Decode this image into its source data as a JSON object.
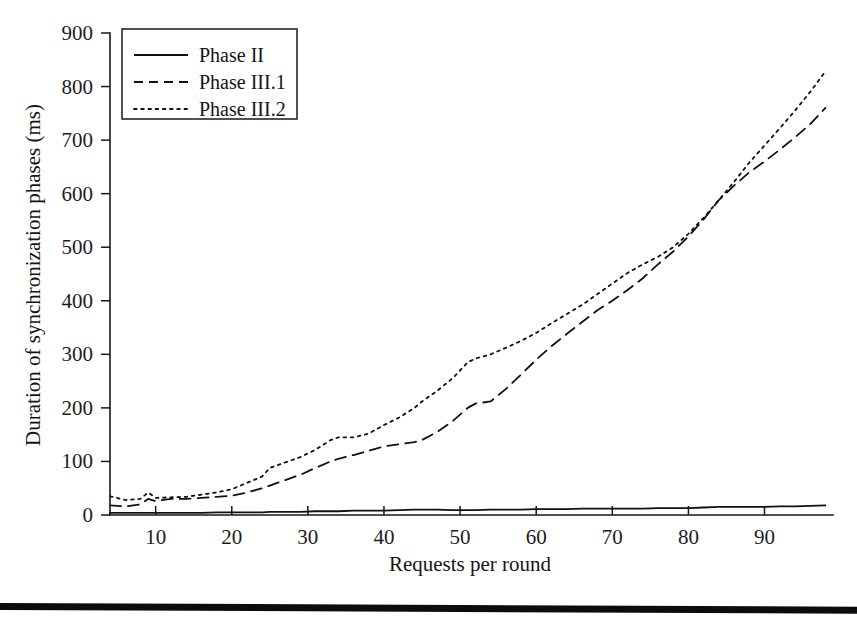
{
  "figure": {
    "background_color": "#ffffff",
    "ink_color": "#141414",
    "bottom_rule": true
  },
  "chart_data": {
    "type": "line",
    "title": "",
    "subtitle": "",
    "xlabel": "Requests per round",
    "ylabel": "Duration of synchronization phases (ms)",
    "xlim": [
      4,
      99
    ],
    "ylim": [
      0,
      900
    ],
    "xticks": [
      10,
      20,
      30,
      40,
      50,
      60,
      70,
      80,
      90
    ],
    "xtick_labels": [
      "10",
      "20",
      "30",
      "40",
      "50",
      "60",
      "70",
      "80",
      "90"
    ],
    "yticks": [
      0,
      100,
      200,
      300,
      400,
      500,
      600,
      700,
      800,
      900
    ],
    "ytick_labels": [
      "0",
      "100",
      "200",
      "300",
      "400",
      "500",
      "600",
      "700",
      "800",
      "900"
    ],
    "grid": false,
    "legend_position": "upper left",
    "legend_entries": [
      "Phase II",
      "Phase III.1",
      "Phase III.2"
    ],
    "x": [
      4,
      6,
      8,
      9,
      10,
      12,
      14,
      16,
      18,
      20,
      22,
      24,
      25,
      27,
      29,
      31,
      33,
      34,
      36,
      38,
      40,
      42,
      44,
      45,
      47,
      49,
      51,
      52,
      54,
      56,
      58,
      60,
      62,
      64,
      66,
      68,
      70,
      72,
      74,
      76,
      78,
      80,
      82,
      84,
      86,
      88,
      90,
      92,
      94,
      96,
      98
    ],
    "series": [
      {
        "name": "Phase II",
        "style": "solid",
        "color": "#111111",
        "values": [
          4,
          4,
          4,
          4,
          4,
          4,
          4,
          4,
          5,
          5,
          5,
          5,
          6,
          6,
          6,
          7,
          7,
          7,
          8,
          8,
          8,
          9,
          10,
          10,
          10,
          9,
          9,
          9,
          10,
          10,
          10,
          11,
          11,
          11,
          12,
          12,
          12,
          12,
          12,
          13,
          13,
          13,
          14,
          15,
          15,
          15,
          15,
          16,
          16,
          17,
          18
        ]
      },
      {
        "name": "Phase III.1",
        "style": "dashed",
        "color": "#111111",
        "values": [
          18,
          16,
          20,
          30,
          26,
          30,
          30,
          32,
          34,
          36,
          42,
          50,
          55,
          65,
          75,
          88,
          100,
          105,
          112,
          120,
          128,
          132,
          136,
          140,
          155,
          175,
          200,
          208,
          212,
          235,
          262,
          290,
          315,
          338,
          360,
          382,
          400,
          420,
          442,
          468,
          492,
          520,
          552,
          588,
          615,
          640,
          660,
          682,
          705,
          730,
          760
        ]
      },
      {
        "name": "Phase III.2",
        "style": "dotted",
        "color": "#111111",
        "values": [
          35,
          28,
          30,
          42,
          32,
          33,
          34,
          38,
          42,
          48,
          60,
          72,
          88,
          98,
          108,
          122,
          140,
          145,
          145,
          152,
          168,
          182,
          200,
          212,
          232,
          255,
          285,
          292,
          300,
          312,
          325,
          340,
          358,
          375,
          392,
          412,
          432,
          452,
          468,
          482,
          500,
          525,
          555,
          588,
          622,
          658,
          690,
          722,
          755,
          790,
          828
        ]
      }
    ]
  }
}
